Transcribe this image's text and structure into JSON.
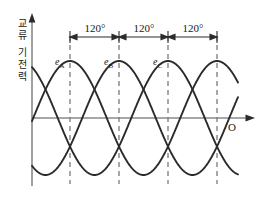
{
  "figure": {
    "title_y_axis": "교류 기전력",
    "y_axis_chars": [
      "교",
      "류",
      "기",
      "전",
      "력"
    ],
    "origin_label": "O",
    "angle_labels": [
      "120",
      "120",
      "120"
    ],
    "angle_unit": "°",
    "wave_labels": [
      "e",
      "e",
      "e"
    ],
    "wave_subscripts": [
      "A",
      "B",
      "C"
    ],
    "colors": {
      "curve": "#2b2b2b",
      "axis": "#808080",
      "dashed": "#7a7a7a",
      "text": "#1a1a1a",
      "background": "#ffffff"
    }
  },
  "chart_data": {
    "type": "line",
    "title": "",
    "xlabel": "O",
    "ylabel": "교류 기전력",
    "x": [
      0,
      15,
      30,
      45,
      60,
      75,
      90,
      105,
      120,
      135,
      150,
      165,
      180,
      195,
      210,
      225,
      240,
      255,
      270,
      285,
      300,
      315,
      330,
      345,
      360,
      375,
      390,
      405,
      420,
      435,
      450,
      465,
      480,
      495,
      510,
      525,
      540
    ],
    "series": [
      {
        "name": "eA",
        "label": "e_A",
        "phase_deg": 0,
        "amplitude": 1,
        "peak_at_deg": [
          90,
          450
        ],
        "values": [
          0,
          0.259,
          0.5,
          0.707,
          0.866,
          0.966,
          1.0,
          0.966,
          0.866,
          0.707,
          0.5,
          0.259,
          0,
          -0.259,
          -0.5,
          -0.707,
          -0.866,
          -0.966,
          -1.0,
          -0.966,
          -0.866,
          -0.707,
          -0.5,
          -0.259,
          0,
          0.259,
          0.5,
          0.707,
          0.866,
          0.966,
          1.0,
          0.966,
          0.866,
          0.707,
          0.5,
          0.259,
          0
        ]
      },
      {
        "name": "eB",
        "label": "e_B",
        "phase_deg": -120,
        "amplitude": 1,
        "peak_at_deg": [
          210
        ],
        "values": [
          -0.866,
          -0.966,
          -1.0,
          -0.966,
          -0.866,
          -0.707,
          -0.5,
          -0.259,
          0,
          0.259,
          0.5,
          0.707,
          0.866,
          0.966,
          1.0,
          0.966,
          0.866,
          0.707,
          0.5,
          0.259,
          0,
          -0.259,
          -0.5,
          -0.707,
          -0.866,
          -0.966,
          -1.0,
          -0.966,
          -0.866,
          -0.707,
          -0.5,
          -0.259,
          0,
          0.259,
          0.5,
          0.707,
          0.866
        ]
      },
      {
        "name": "eC",
        "label": "e_C",
        "phase_deg": -240,
        "amplitude": 1,
        "peak_at_deg": [
          330
        ],
        "values": [
          0.866,
          0.707,
          0.5,
          0.259,
          0,
          -0.259,
          -0.5,
          -0.707,
          -0.866,
          -0.966,
          -1.0,
          -0.966,
          -0.866,
          -0.707,
          -0.5,
          -0.259,
          0,
          0.259,
          0.5,
          0.707,
          0.866,
          0.966,
          1.0,
          0.966,
          0.866,
          0.707,
          0.5,
          0.259,
          0,
          -0.259,
          -0.5,
          -0.707,
          -0.866,
          -0.966,
          -1.0,
          -0.966,
          -0.866
        ]
      }
    ],
    "xlim": [
      -30,
      510
    ],
    "ylim": [
      -1.15,
      1.15
    ],
    "grid": false,
    "legend": "inline-labels",
    "annotations": [
      {
        "text": "120°",
        "between_deg": [
          90,
          210
        ]
      },
      {
        "text": "120°",
        "between_deg": [
          210,
          330
        ]
      },
      {
        "text": "120°",
        "between_deg": [
          330,
          450
        ]
      }
    ],
    "dashed_verticals_deg": [
      90,
      210,
      330,
      450
    ]
  }
}
